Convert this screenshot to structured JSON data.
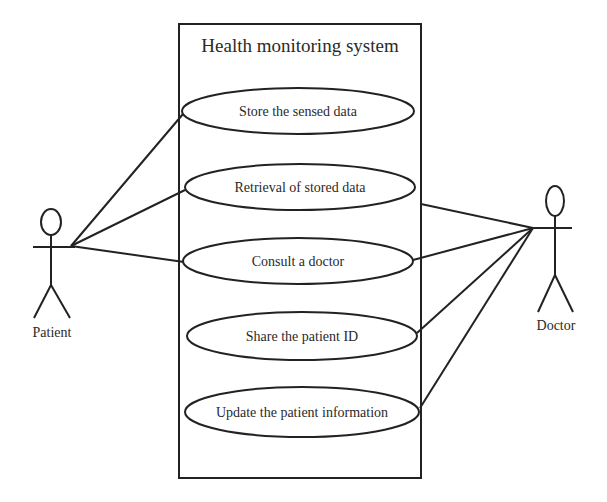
{
  "diagram": {
    "type": "uml-use-case",
    "system": {
      "title": "Health monitoring system"
    },
    "actors": [
      {
        "id": "patient",
        "label": "Patient"
      },
      {
        "id": "doctor",
        "label": "Doctor"
      }
    ],
    "use_cases": [
      {
        "id": "store",
        "label": "Store the sensed data"
      },
      {
        "id": "retrieve",
        "label": "Retrieval of stored data"
      },
      {
        "id": "consult",
        "label": "Consult a doctor"
      },
      {
        "id": "share",
        "label": "Share the patient ID"
      },
      {
        "id": "update",
        "label": "Update the patient information"
      }
    ],
    "associations": [
      {
        "actor": "patient",
        "use_case": "store"
      },
      {
        "actor": "patient",
        "use_case": "retrieve"
      },
      {
        "actor": "patient",
        "use_case": "consult"
      },
      {
        "actor": "doctor",
        "use_case": "retrieve"
      },
      {
        "actor": "doctor",
        "use_case": "consult"
      },
      {
        "actor": "doctor",
        "use_case": "share"
      },
      {
        "actor": "doctor",
        "use_case": "update"
      }
    ],
    "colors": {
      "line": "#222222",
      "text": "#2a2a2a",
      "background": "#ffffff"
    }
  }
}
